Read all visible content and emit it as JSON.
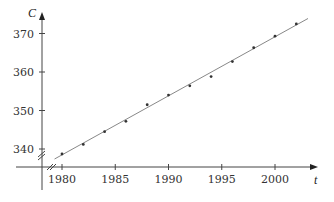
{
  "chart_data": {
    "type": "scatter",
    "title": "",
    "xlabel": "t",
    "ylabel": "C",
    "x": [
      1980,
      1982,
      1984,
      1986,
      1988,
      1990,
      1992,
      1994,
      1996,
      1998,
      2000,
      2002
    ],
    "series": [
      {
        "name": "data points",
        "values": [
          338.7,
          341.2,
          344.5,
          347.2,
          351.5,
          354.0,
          356.4,
          358.8,
          362.7,
          366.3,
          369.3,
          372.5
        ]
      },
      {
        "name": "linear fit",
        "type": "line",
        "x": [
          1979.3,
          2003.1
        ],
        "values": [
          337.4,
          373.9
        ]
      }
    ],
    "x_ticks": [
      1980,
      1985,
      1990,
      1995,
      2000
    ],
    "y_ticks": [
      340,
      350,
      360,
      370
    ],
    "x_tick_labels": [
      "1980",
      "1985",
      "1990",
      "1995",
      "2000"
    ],
    "y_tick_labels": [
      "340",
      "350",
      "360",
      "370"
    ],
    "axis_breaks": [
      "x",
      "y"
    ],
    "grid": false,
    "legend": null
  }
}
